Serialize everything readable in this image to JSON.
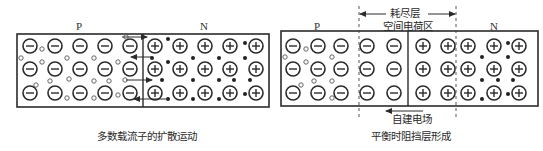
{
  "left_panel": {
    "p_label": "P",
    "n_label": "N",
    "caption": "多数载流子的扩散运动",
    "box": {
      "x1": 17,
      "y1": 34,
      "x2": 269,
      "y2": 107,
      "junction_x": 143
    },
    "acceptor_ions": {
      "cols": [
        30,
        55,
        80,
        105,
        130
      ],
      "rows": [
        46,
        69,
        93
      ]
    },
    "donor_ions": {
      "cols": [
        155,
        180,
        205,
        230,
        256
      ],
      "rows": [
        46,
        69,
        93
      ]
    },
    "holes": [
      [
        42,
        49
      ],
      [
        21,
        58
      ],
      [
        42,
        62
      ],
      [
        67,
        58
      ],
      [
        94,
        58
      ],
      [
        118,
        62
      ],
      [
        50,
        81
      ],
      [
        36,
        85
      ],
      [
        69,
        79
      ],
      [
        94,
        81
      ],
      [
        109,
        81
      ],
      [
        125,
        80
      ],
      [
        67,
        98
      ],
      [
        94,
        98
      ],
      [
        118,
        95
      ],
      [
        126,
        37
      ]
    ],
    "electrons": [
      [
        168,
        39
      ],
      [
        245,
        43
      ],
      [
        152,
        58
      ],
      [
        168,
        62
      ],
      [
        193,
        58
      ],
      [
        219,
        58
      ],
      [
        245,
        58
      ],
      [
        162,
        80
      ],
      [
        193,
        80
      ],
      [
        219,
        80
      ],
      [
        234,
        80
      ],
      [
        250,
        80
      ],
      [
        168,
        99
      ],
      [
        193,
        99
      ],
      [
        219,
        99
      ],
      [
        245,
        94
      ]
    ],
    "arrows": [
      {
        "x1": 122,
        "y1": 37,
        "x2": 147,
        "y2": 37,
        "dir": "right"
      },
      {
        "x1": 152,
        "y1": 57,
        "x2": 131,
        "y2": 57,
        "dir": "left"
      },
      {
        "x1": 126,
        "y1": 80,
        "x2": 152,
        "y2": 80,
        "dir": "right"
      },
      {
        "x1": 166,
        "y1": 99,
        "x2": 134,
        "y2": 99,
        "dir": "left"
      }
    ]
  },
  "right_panel": {
    "p_label": "P",
    "n_label": "N",
    "depletion_label": "耗尽层",
    "space_charge_label": "空间电荷区",
    "field_label": "自建电场",
    "caption": "平衡时阻挡层形成",
    "box": {
      "x1": 281,
      "y1": 31,
      "x2": 538,
      "y2": 106,
      "junction_x": 408,
      "dash_left": 359,
      "dash_right": 456
    },
    "acceptor_ions": {
      "cols": [
        293,
        318,
        341,
        367,
        394
      ],
      "rows": [
        46,
        69,
        93
      ]
    },
    "donor_ions": {
      "cols": [
        423,
        448,
        468,
        494,
        519
      ],
      "rows": [
        46,
        69,
        93
      ]
    },
    "holes": [
      [
        306,
        49
      ],
      [
        285,
        57
      ],
      [
        306,
        62
      ],
      [
        332,
        57
      ],
      [
        301,
        85
      ],
      [
        314,
        81
      ],
      [
        332,
        81
      ],
      [
        332,
        98
      ]
    ],
    "electrons": [
      [
        508,
        43
      ],
      [
        482,
        57
      ],
      [
        508,
        57
      ],
      [
        482,
        80
      ],
      [
        498,
        80
      ],
      [
        513,
        80
      ],
      [
        482,
        99
      ],
      [
        508,
        94
      ]
    ]
  },
  "colors": {
    "stroke": "#2b2b2b",
    "text": "#333333",
    "background": "#ffffff"
  }
}
